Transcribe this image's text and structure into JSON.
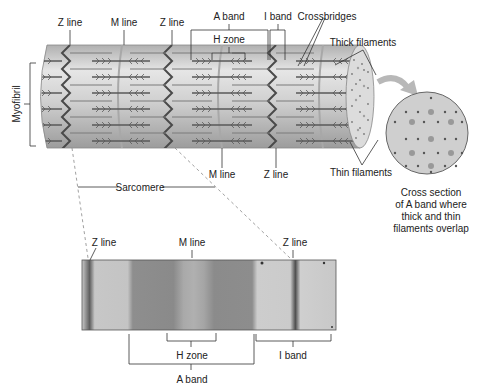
{
  "diagram": {
    "colors": {
      "cylinder_light": "#d9d9d9",
      "cylinder_mid": "#bdbdbd",
      "cylinder_dark": "#9a9a9a",
      "z_line": "#555555",
      "thick_filament": "#6e6e6e",
      "thin_filament": "#888888",
      "cross_section_bg": "#cfcfcf",
      "arrow": "#b8b8b8",
      "micrograph_bg": "#bdbdbd",
      "micrograph_dark": "#7d7d7d",
      "line": "#333333"
    },
    "top_labels": {
      "z_line_1": "Z line",
      "m_line_1": "M line",
      "z_line_2": "Z line",
      "a_band": "A band",
      "h_zone": "H zone",
      "i_band": "I band",
      "crossbridges": "Crossbridges",
      "thick_filaments": "Thick filaments",
      "thin_filaments": "Thin filaments",
      "myofibril": "Myofibril",
      "m_line_2": "M line",
      "z_line_3": "Z line",
      "sarcomere": "Sarcomere"
    },
    "cross_section": {
      "caption_line1": "Cross section",
      "caption_line2": "of A band where",
      "caption_line3": "thick and thin",
      "caption_line4": "filaments overlap"
    },
    "micrograph": {
      "z_line_left": "Z line",
      "m_line": "M line",
      "z_line_right": "Z line",
      "h_zone": "H zone",
      "i_band": "I band",
      "a_band": "A band"
    }
  }
}
